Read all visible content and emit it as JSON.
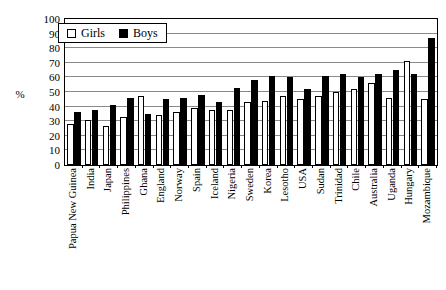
{
  "chart_data": {
    "type": "bar",
    "title": "",
    "xlabel": "",
    "ylabel": "%",
    "ylim": [
      0,
      100
    ],
    "ytick_step": 10,
    "grid": true,
    "legend_position": "top-left",
    "categories": [
      "Papua New Guinea",
      "India",
      "Japan",
      "Philippines",
      "Ghana",
      "England",
      "Norway",
      "Spain",
      "Iceland",
      "Nigeria",
      "Sweden",
      "Korea",
      "Lesotho",
      "USA",
      "Sudan",
      "Trinidad",
      "Chile",
      "Australia",
      "Uganda",
      "Hungary",
      "Mozambique"
    ],
    "ytick_labels": [
      "0",
      "10",
      "20",
      "30",
      "40",
      "50",
      "60",
      "70",
      "80",
      "90",
      "100"
    ],
    "series": [
      {
        "name": "Girls",
        "color": "#ffffff",
        "values": [
          28,
          31,
          27,
          33,
          47,
          34,
          36,
          39,
          38,
          38,
          43,
          44,
          47,
          45,
          47,
          50,
          52,
          56,
          46,
          71,
          45
        ]
      },
      {
        "name": "Boys",
        "color": "#000000",
        "values": [
          36,
          38,
          41,
          46,
          35,
          45,
          46,
          48,
          43,
          53,
          58,
          61,
          60,
          52,
          61,
          62,
          60,
          62,
          65,
          62,
          87
        ]
      }
    ]
  },
  "legend": {
    "items": [
      {
        "label": "Girls",
        "marker": "hollow-square"
      },
      {
        "label": "Boys",
        "marker": "filled-square"
      }
    ]
  },
  "axis": {
    "y_title": "%"
  }
}
